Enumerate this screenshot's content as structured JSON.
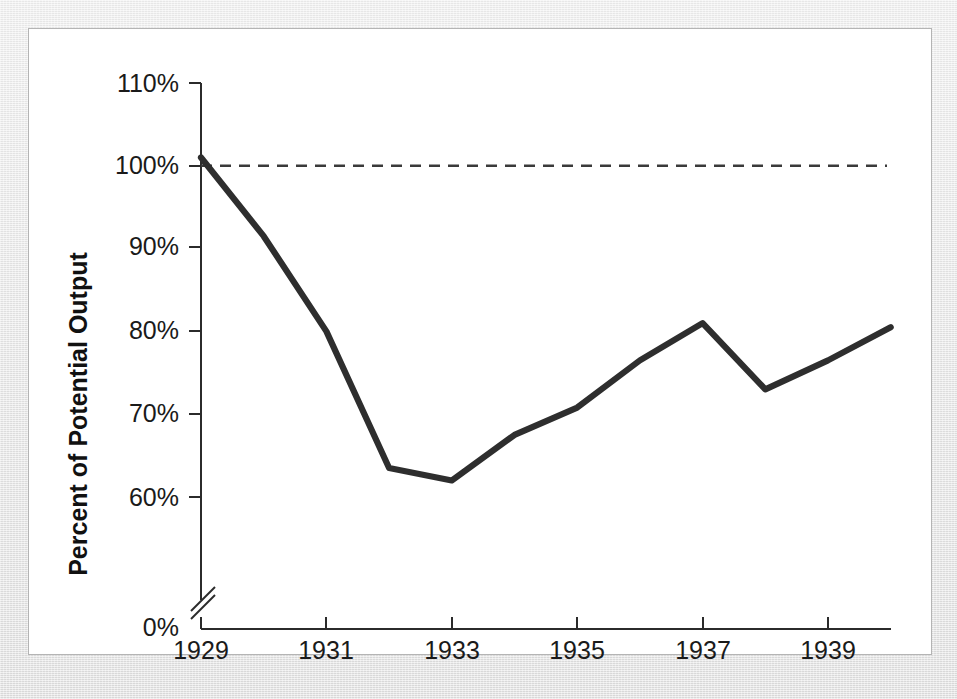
{
  "figure": {
    "background_color": "#e6e6e6",
    "card_color": "#ffffff",
    "card_border_color": "#b4b4b4",
    "line_color": "#2e2e2e",
    "reference_line_color": "#3a3a3a",
    "axis_color": "#2b2b2b"
  },
  "chart_data": {
    "type": "line",
    "title": "",
    "subtitle": "",
    "xlabel": "",
    "ylabel": "Percent of Potential Output",
    "x": [
      1929,
      1930,
      1931,
      1932,
      1933,
      1934,
      1935,
      1936,
      1937,
      1938,
      1939,
      1940
    ],
    "values": [
      101.0,
      91.5,
      80.0,
      63.5,
      62.0,
      67.5,
      70.8,
      76.5,
      81.0,
      73.0,
      76.5,
      80.5
    ],
    "series": [
      {
        "name": "Actual output as percent of potential output",
        "values": [
          101.0,
          91.5,
          80.0,
          63.5,
          62.0,
          67.5,
          70.8,
          76.5,
          81.0,
          73.0,
          76.5,
          80.5
        ]
      }
    ],
    "xlim": [
      1929,
      1940
    ],
    "ylim": [
      0,
      110
    ],
    "y_axis_break": true,
    "y_break_between": [
      0,
      60
    ],
    "y_visible_range": [
      56,
      110
    ],
    "grid": false,
    "legend": false,
    "legend_position": "none",
    "annotations": [
      {
        "name": "potential-output-reference",
        "type": "horizontal-dashed-line",
        "y": 100,
        "label": ""
      }
    ],
    "y_tick_labels": [
      "110%",
      "100%",
      "90%",
      "80%",
      "70%",
      "60%",
      "0%"
    ],
    "y_tick_values": [
      110,
      100,
      90,
      80,
      70,
      60,
      0
    ],
    "x_tick_labels": [
      "1929",
      "1931",
      "1933",
      "1935",
      "1937",
      "1939"
    ],
    "x_tick_values": [
      1929,
      1931,
      1933,
      1935,
      1937,
      1939
    ]
  },
  "axes": {
    "y_title": "Percent of Potential Output",
    "y_ticks": [
      {
        "label": "110%",
        "value": 110
      },
      {
        "label": "100%",
        "value": 100
      },
      {
        "label": "90%",
        "value": 90
      },
      {
        "label": "80%",
        "value": 80
      },
      {
        "label": "70%",
        "value": 70
      },
      {
        "label": "60%",
        "value": 60
      },
      {
        "label": "0%",
        "value": 0
      }
    ],
    "x_ticks": [
      {
        "label": "1929",
        "value": 1929
      },
      {
        "label": "1931",
        "value": 1931
      },
      {
        "label": "1933",
        "value": 1933
      },
      {
        "label": "1935",
        "value": 1935
      },
      {
        "label": "1937",
        "value": 1937
      },
      {
        "label": "1939",
        "value": 1939
      }
    ]
  }
}
